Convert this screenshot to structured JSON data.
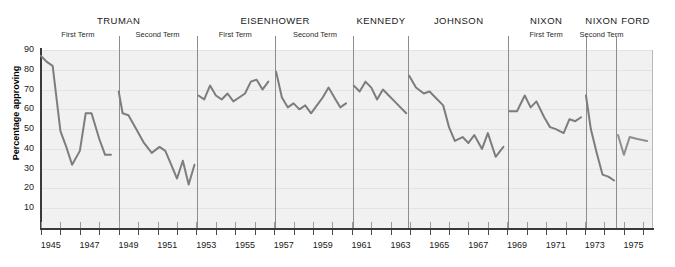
{
  "chart_data": {
    "type": "line",
    "title": "",
    "xlabel": "",
    "ylabel": "Percentage approving",
    "xlim": [
      1945,
      1976.5
    ],
    "ylim": [
      0,
      90
    ],
    "grid": true,
    "legend": "none",
    "line_color": "#7d7d7d",
    "plot_background": "#f1f1f1",
    "divider_color": "#8d8d8d",
    "y_ticks": [
      90,
      80,
      70,
      60,
      50,
      40,
      30,
      20,
      10
    ],
    "x_ticks_labeled": [
      1945,
      1947,
      1949,
      1951,
      1953,
      1955,
      1957,
      1959,
      1961,
      1963,
      1965,
      1967,
      1969,
      1971,
      1973,
      1975
    ],
    "x_ticks_all": [
      1945,
      1946,
      1947,
      1948,
      1949,
      1950,
      1951,
      1952,
      1953,
      1954,
      1955,
      1956,
      1957,
      1958,
      1959,
      1960,
      1961,
      1962,
      1963,
      1964,
      1965,
      1966,
      1967,
      1968,
      1969,
      1970,
      1971,
      1972,
      1973,
      1974,
      1975,
      1976
    ],
    "series": [
      {
        "name": "Truman First Term",
        "x": [
          1945.0,
          1945.3,
          1945.6,
          1946.0,
          1946.3,
          1946.6,
          1947.0,
          1947.3,
          1947.6,
          1948.0,
          1948.3,
          1948.6
        ],
        "values": [
          87,
          84,
          82,
          49,
          41,
          32,
          39,
          58,
          58,
          45,
          37,
          37
        ]
      },
      {
        "name": "Truman Second Term",
        "x": [
          1949.0,
          1949.2,
          1949.5,
          1949.9,
          1950.3,
          1950.7,
          1951.1,
          1951.4,
          1951.7,
          1952.0,
          1952.3,
          1952.6,
          1952.9
        ],
        "values": [
          69,
          58,
          57,
          50,
          43,
          38,
          41,
          39,
          32,
          25,
          34,
          22,
          32
        ]
      },
      {
        "name": "Eisenhower First Term",
        "x": [
          1953.1,
          1953.4,
          1953.7,
          1954.0,
          1954.3,
          1954.6,
          1954.9,
          1955.2,
          1955.5,
          1955.8,
          1956.1,
          1956.4,
          1956.7
        ],
        "values": [
          67,
          65,
          72,
          67,
          65,
          68,
          64,
          66,
          68,
          74,
          75,
          70,
          74
        ]
      },
      {
        "name": "Eisenhower Second Term",
        "x": [
          1957.1,
          1957.4,
          1957.7,
          1958.0,
          1958.3,
          1958.6,
          1958.9,
          1959.2,
          1959.5,
          1959.8,
          1960.1,
          1960.4,
          1960.7
        ],
        "values": [
          79,
          66,
          61,
          63,
          60,
          62,
          58,
          62,
          66,
          71,
          66,
          61,
          63
        ]
      },
      {
        "name": "Kennedy",
        "x": [
          1961.1,
          1961.4,
          1961.7,
          1962.0,
          1962.3,
          1962.6,
          1962.9,
          1963.2,
          1963.5,
          1963.8
        ],
        "values": [
          72,
          69,
          74,
          71,
          65,
          70,
          67,
          64,
          61,
          58
        ]
      },
      {
        "name": "Johnson",
        "x": [
          1963.95,
          1964.3,
          1964.7,
          1965.0,
          1965.3,
          1965.7,
          1966.0,
          1966.3,
          1966.7,
          1967.0,
          1967.3,
          1967.7,
          1968.0,
          1968.4,
          1968.8
        ],
        "values": [
          77,
          71,
          68,
          69,
          66,
          62,
          51,
          44,
          46,
          43,
          47,
          40,
          48,
          36,
          41
        ]
      },
      {
        "name": "Nixon First Term",
        "x": [
          1969.1,
          1969.5,
          1969.9,
          1970.2,
          1970.5,
          1970.9,
          1971.2,
          1971.5,
          1971.9,
          1972.2,
          1972.5,
          1972.8
        ],
        "values": [
          59,
          59,
          67,
          61,
          64,
          56,
          51,
          50,
          48,
          55,
          54,
          56
        ]
      },
      {
        "name": "Nixon Second Term",
        "x": [
          1973.05,
          1973.3,
          1973.6,
          1973.9,
          1974.2,
          1974.5
        ],
        "values": [
          67,
          50,
          38,
          27,
          26,
          24
        ]
      },
      {
        "name": "Ford",
        "x": [
          1974.7,
          1975.0,
          1975.3,
          1975.7,
          1976.2
        ],
        "values": [
          47,
          37,
          46,
          45,
          44
        ]
      }
    ],
    "presidents": [
      {
        "name": "TRUMAN",
        "start": 1945.0,
        "end": 1953.05,
        "center": 1949.0,
        "terms": [
          {
            "label": "First Term",
            "center": 1946.9
          },
          {
            "label": "Second Term",
            "center": 1951.0
          }
        ]
      },
      {
        "name": "EISENHOWER",
        "start": 1953.05,
        "end": 1961.05,
        "center": 1957.05,
        "terms": [
          {
            "label": "First Term",
            "center": 1955.0
          },
          {
            "label": "Second Term",
            "center": 1959.1
          }
        ]
      },
      {
        "name": "KENNEDY",
        "start": 1961.05,
        "end": 1963.9,
        "center": 1962.5,
        "terms": []
      },
      {
        "name": "JOHNSON",
        "start": 1963.9,
        "end": 1969.05,
        "center": 1966.5,
        "terms": []
      },
      {
        "name": "NIXON",
        "start": 1969.05,
        "end": 1973.05,
        "center": 1971.0,
        "terms": [
          {
            "label": "First Term",
            "center": 1971.0
          }
        ]
      },
      {
        "name": "NIXON",
        "start": 1973.05,
        "end": 1974.62,
        "center": 1973.85,
        "terms": [
          {
            "label": "Second Term",
            "center": 1973.85
          }
        ]
      },
      {
        "name": "FORD",
        "start": 1974.62,
        "end": 1976.5,
        "center": 1975.6,
        "terms": []
      }
    ],
    "dividers": [
      1949.0,
      1953.05,
      1957.05,
      1961.05,
      1963.9,
      1969.05,
      1973.05,
      1974.62
    ]
  }
}
